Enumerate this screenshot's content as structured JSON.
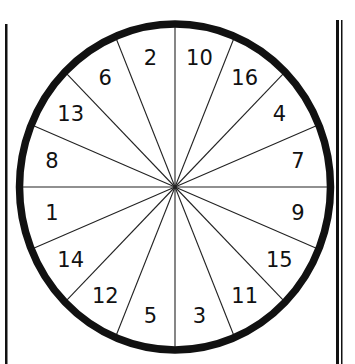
{
  "diagram": {
    "type": "numbered-wheel",
    "sector_count": 16,
    "sectors_clockwise_from_top": [
      "10",
      "16",
      "4",
      "7",
      "9",
      "15",
      "11",
      "3",
      "5",
      "12",
      "14",
      "1",
      "8",
      "13",
      "6",
      "2"
    ],
    "colors": {
      "ink": "#111111",
      "background": "#ffffff"
    }
  }
}
